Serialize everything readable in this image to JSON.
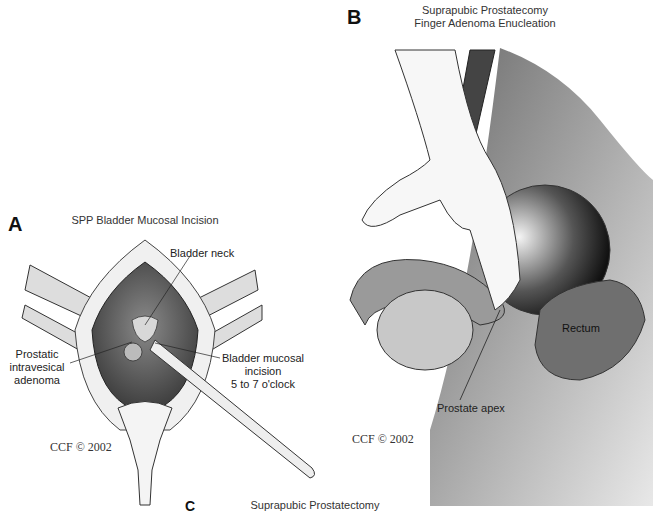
{
  "panel_a": {
    "letter": "A",
    "title": "SPP Bladder Mucosal Incision",
    "labels": {
      "bladder_neck": "Bladder neck",
      "adenoma_line1": "Prostatic",
      "adenoma_line2": "intravesical",
      "adenoma_line3": "adenoma",
      "incision_line1": "Bladder mucosal",
      "incision_line2": "incision",
      "incision_line3": "5 to 7 o'clock"
    },
    "copyright": "CCF © 2002"
  },
  "panel_b": {
    "letter": "B",
    "title_line1": "Suprapubic Prostatecomy",
    "title_line2": "Finger Adenoma Enucleation",
    "labels": {
      "rectum": "Rectum",
      "prostate_apex": "Prostate apex"
    },
    "copyright": "CCF © 2002"
  },
  "panel_c": {
    "letter": "C",
    "title": "Suprapubic Prostatectomy"
  }
}
